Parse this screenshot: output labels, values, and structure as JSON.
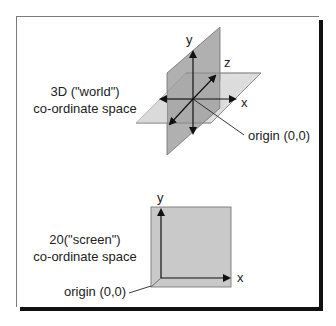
{
  "figure": {
    "world_space": {
      "caption_line1": "3D (\"world\")",
      "caption_line2": "co-ordinate space",
      "axes": {
        "y": "y",
        "z": "z",
        "x": "x"
      },
      "origin_label": "origin (0,0)"
    },
    "screen_space": {
      "caption_line1": "20(\"screen\")",
      "caption_line2": "co-ordinate space",
      "axes": {
        "y": "y",
        "x": "x"
      },
      "origin_label": "origin (0,0)"
    }
  },
  "colors": {
    "border": "#7a7a7a",
    "shadow": "#111111",
    "vertical_plane": "#9e9e9e",
    "horizontal_plane": "#d6d6d6",
    "screen_plane": "#c8c8c8",
    "axis": "#111111",
    "text": "#222222"
  }
}
